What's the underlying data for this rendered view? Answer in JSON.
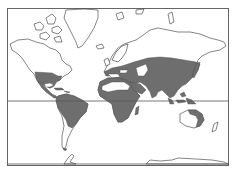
{
  "map": {
    "projection": "Mercator world map",
    "colors": {
      "background": "#ffffff",
      "land_outline": "#333333",
      "distribution_fill": "#6e6e6e",
      "frame": "#666666"
    },
    "reference_lines": [
      "equator",
      "southern boundary line"
    ],
    "shaded_regions": [
      "southern United States",
      "Mexico and Central America",
      "Caribbean islands",
      "northern and central South America",
      "southern Europe and Mediterranean",
      "North Africa coast",
      "sub-Saharan Africa",
      "Madagascar",
      "Middle East",
      "central and southern Asia",
      "India",
      "China",
      "Japan",
      "Southeast Asia",
      "Indonesia and New Guinea",
      "northern and eastern Australia"
    ],
    "unshaded_regions": [
      "Canada",
      "Alaska",
      "Greenland",
      "northern Europe",
      "Siberia",
      "Sahara",
      "Arabian/Central Asian desert pockets",
      "southern South America",
      "central Australia",
      "New Zealand",
      "Antarctica"
    ]
  }
}
